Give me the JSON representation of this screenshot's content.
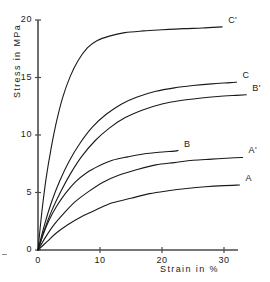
{
  "chart_data": {
    "type": "line",
    "title": "",
    "xlabel": "Strain in %",
    "ylabel": "Stress in MPa",
    "xlim": [
      0,
      32
    ],
    "ylim": [
      0,
      20
    ],
    "xticks": [
      0,
      10,
      20,
      30
    ],
    "yticks": [
      0,
      5,
      10,
      15,
      20
    ],
    "xtick_labels": [
      "0",
      "10",
      "20",
      "30"
    ],
    "ytick_labels": [
      "0",
      "5",
      "10",
      "15",
      "20"
    ],
    "grid": false,
    "legend": "inline-end-labels",
    "series": [
      {
        "name": "C'",
        "label": "C'",
        "x": [
          0,
          0.6,
          1.3,
          2.1,
          3.0,
          4.0,
          5.2,
          6.5,
          8.0,
          9.5,
          11.5,
          14.0,
          17.0,
          20.0,
          23.5,
          26.5,
          29.7
        ],
        "y": [
          0,
          3.2,
          6.2,
          8.8,
          11.2,
          13.3,
          15.1,
          16.5,
          17.6,
          18.2,
          18.6,
          18.9,
          19.05,
          19.15,
          19.25,
          19.3,
          19.4
        ]
      },
      {
        "name": "C",
        "label": "C",
        "x": [
          0,
          1.0,
          2.2,
          3.5,
          5.0,
          6.8,
          8.8,
          11.0,
          13.5,
          16.0,
          19.0,
          22.0,
          25.0,
          28.0,
          31.0,
          32.0
        ],
        "y": [
          0,
          2.1,
          4.2,
          6.0,
          7.7,
          9.3,
          10.7,
          11.8,
          12.7,
          13.3,
          13.8,
          14.1,
          14.3,
          14.45,
          14.55,
          14.6
        ]
      },
      {
        "name": "B'",
        "label": "B'",
        "x": [
          0,
          1.0,
          2.2,
          3.6,
          5.2,
          7.0,
          9.2,
          11.5,
          14.0,
          17.0,
          20.0,
          23.0,
          26.0,
          29.0,
          32.0,
          33.6
        ],
        "y": [
          0,
          1.7,
          3.4,
          5.0,
          6.6,
          8.1,
          9.5,
          10.6,
          11.5,
          12.2,
          12.7,
          13.0,
          13.2,
          13.35,
          13.45,
          13.5
        ]
      },
      {
        "name": "B",
        "label": "B",
        "x": [
          0,
          0.8,
          1.8,
          3.0,
          4.4,
          6.0,
          7.8,
          9.8,
          12.0,
          14.5,
          17.0,
          19.5,
          22.0,
          22.6
        ],
        "y": [
          0,
          1.3,
          2.6,
          3.8,
          4.9,
          5.9,
          6.7,
          7.3,
          7.8,
          8.1,
          8.35,
          8.5,
          8.6,
          8.65
        ]
      },
      {
        "name": "A'",
        "label": "A'",
        "x": [
          0,
          1.2,
          2.6,
          4.2,
          6.0,
          8.2,
          10.5,
          13.0,
          16.0,
          19.0,
          22.0,
          25.0,
          28.0,
          31.0,
          33.0
        ],
        "y": [
          0,
          1.1,
          2.2,
          3.2,
          4.2,
          5.1,
          5.9,
          6.5,
          7.0,
          7.4,
          7.6,
          7.8,
          7.9,
          8.0,
          8.05
        ]
      },
      {
        "name": "A",
        "label": "A",
        "x": [
          0,
          1.4,
          3.0,
          4.8,
          7.0,
          9.4,
          12.0,
          15.0,
          18.0,
          21.0,
          24.0,
          27.0,
          30.0,
          32.5
        ],
        "y": [
          0,
          0.7,
          1.5,
          2.2,
          2.9,
          3.5,
          4.1,
          4.5,
          4.9,
          5.15,
          5.35,
          5.5,
          5.6,
          5.65
        ]
      }
    ]
  },
  "axes": {
    "y_title": "Stress in MPa",
    "x_title": "Strain in %",
    "y_labels": [
      "20",
      "15",
      "10",
      "5",
      "0"
    ],
    "x_labels": [
      "0",
      "10",
      "20",
      "30"
    ]
  },
  "labels": {
    "c_prime": "C'",
    "c": "C",
    "b_prime": "B'",
    "b": "B",
    "a_prime": "A'",
    "a": "A"
  },
  "colors": {
    "axis": "#4a4a4a",
    "curve": "#1a1a1a",
    "text": "#1a1a1a",
    "background": "#ffffff"
  }
}
